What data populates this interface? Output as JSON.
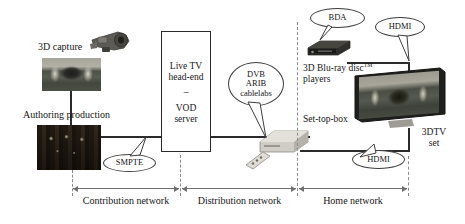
{
  "diagram": {
    "nodes": {
      "capture_label": "3D capture",
      "authoring_label": "Authoring production",
      "headend_line1": "Live TV",
      "headend_line2": "head-end",
      "headend_dash": "–",
      "headend_line3": "VOD",
      "headend_line4": "server",
      "bluray_label": "3D Blu-ray disc",
      "bluray_tm": "TM",
      "bluray_label2": "players",
      "stb_label": "Set-top-box",
      "tv_label1": "3DTV",
      "tv_label2": "set"
    },
    "callouts": {
      "smpte": "SMPTE",
      "dvb_line1": "DVB",
      "dvb_line2": "ARIB",
      "dvb_line3": "cablelabs",
      "bda": "BDA",
      "hdmi_top": "HDMI",
      "hdmi_bottom": "HDMI"
    },
    "networks": [
      {
        "label": "Contribution network"
      },
      {
        "label": "Distribution network"
      },
      {
        "label": "Home network"
      }
    ],
    "colors": {
      "line": "#2b2b2b",
      "divider": "#8a8a8a",
      "text": "#161616",
      "background": "#ffffff"
    }
  }
}
